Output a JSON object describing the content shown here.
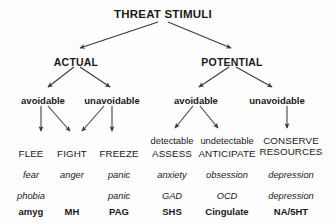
{
  "diagram": {
    "title": "THREAT STIMULI",
    "levels": {
      "level2": [
        {
          "label": "ACTUAL",
          "x": 76,
          "y": 57
        },
        {
          "label": "POTENTIAL",
          "x": 232,
          "y": 57
        }
      ],
      "level3": [
        {
          "label": "avoidable",
          "x": 43,
          "y": 96
        },
        {
          "label": "unavoidable",
          "x": 112,
          "y": 96
        },
        {
          "label": "avoidable",
          "x": 196,
          "y": 96
        },
        {
          "label": "unavoidable",
          "x": 277,
          "y": 96
        }
      ]
    },
    "columns": [
      {
        "id": "flee",
        "x": 31,
        "qualifier": "",
        "head_line1": "FLEE",
        "head_line2": "",
        "emotion": "fear",
        "disorder": "phobia",
        "substrate": "amyg"
      },
      {
        "id": "fight",
        "x": 72,
        "qualifier": "",
        "head_line1": "FIGHT",
        "head_line2": "",
        "emotion": "anger",
        "disorder": "",
        "substrate": "MH"
      },
      {
        "id": "freeze",
        "x": 119,
        "qualifier": "",
        "head_line1": "FREEZE",
        "head_line2": "",
        "emotion": "panic",
        "disorder": "panic",
        "substrate": "PAG"
      },
      {
        "id": "assess",
        "x": 172,
        "qualifier": "detectable",
        "head_line1": "ASSESS",
        "head_line2": "",
        "emotion": "anxiety",
        "disorder": "GAD",
        "substrate": "SHS"
      },
      {
        "id": "anticipate",
        "x": 227,
        "qualifier": "undetectable",
        "head_line1": "ANTICIPATE",
        "head_line2": "",
        "emotion": "obsession",
        "disorder": "OCD",
        "substrate": "Cingulate"
      },
      {
        "id": "conserve-resources",
        "x": 291,
        "qualifier": "",
        "head_line1": "CONSERVE",
        "head_line2": "RESOURCES",
        "emotion": "depression",
        "disorder": "depression",
        "substrate": "NA/5HT"
      }
    ],
    "colors": {
      "background": "#fdfdfd",
      "text": "#1a1a1a",
      "arrow": "#3a3a3a"
    }
  }
}
